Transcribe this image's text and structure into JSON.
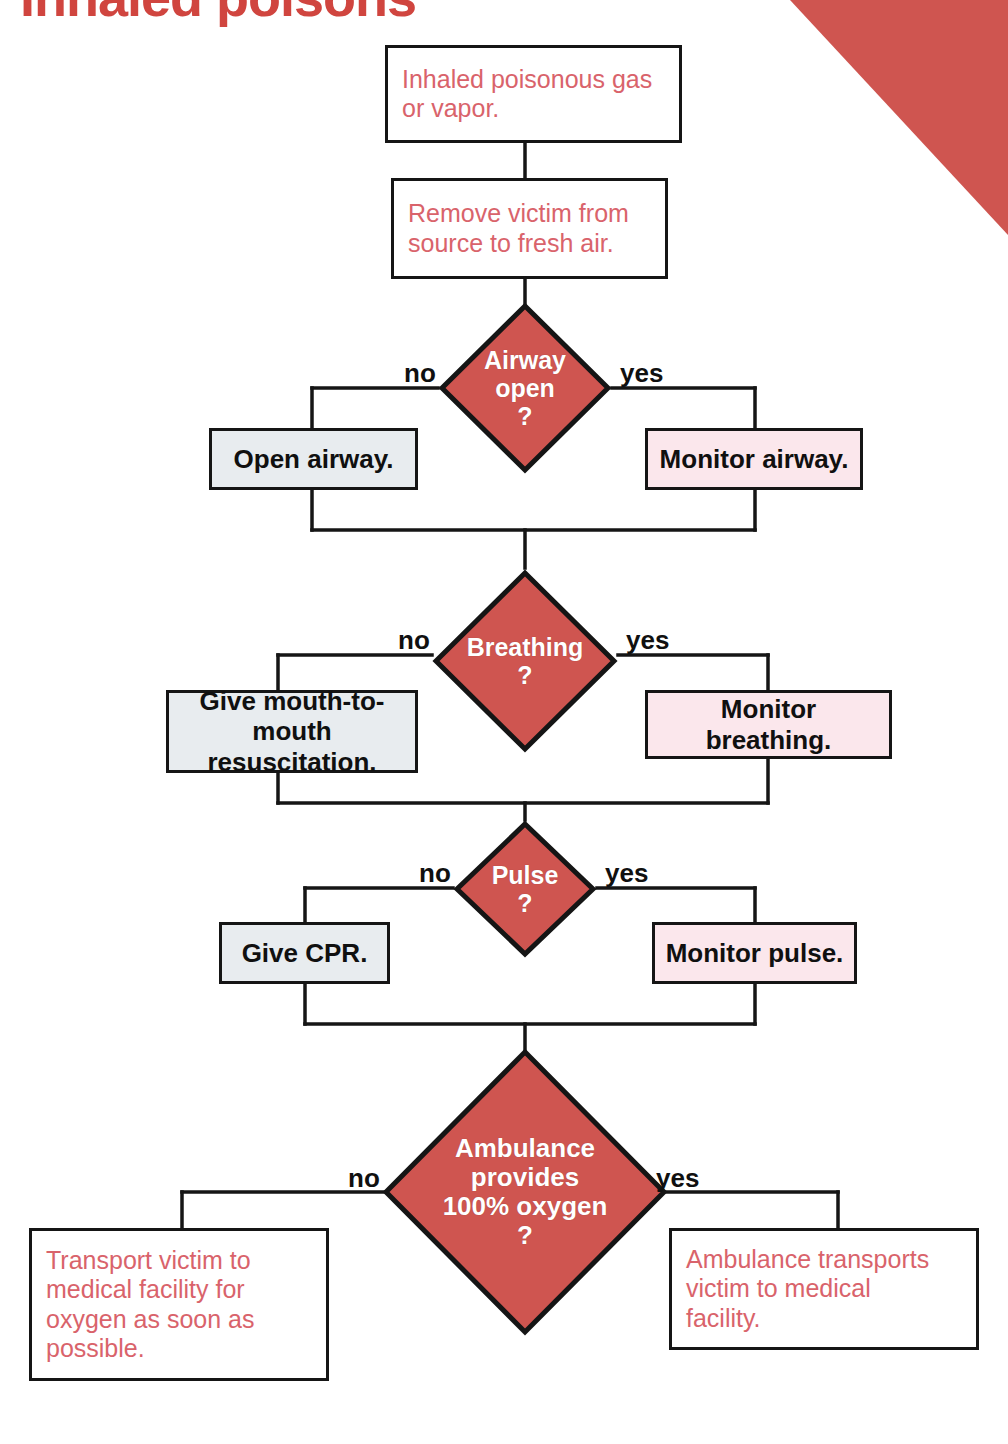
{
  "meta": {
    "title_fragment": "Inhaled poisons",
    "diagram_type": "flowchart",
    "colors": {
      "diamond_fill": "#cf5550",
      "diamond_stroke": "#151515",
      "corner_triangle": "#cf5550",
      "red_text": "#d9636b",
      "no_box_fill": "#e8ecef",
      "yes_box_fill": "#fbe7ec",
      "line": "#151515",
      "background": "#ffffff"
    }
  },
  "edge_labels": {
    "no": "no",
    "yes": "yes"
  },
  "nodes": {
    "start": {
      "id": "inhaled-poison",
      "kind": "terminal",
      "text": "Inhaled poisonous gas\nor vapor."
    },
    "remove": {
      "id": "remove-victim",
      "kind": "process",
      "text": "Remove victim from\nsource to fresh air."
    },
    "airway_decision": {
      "id": "airway-open",
      "kind": "decision",
      "text": "Airway\nopen\n?"
    },
    "airway_no": {
      "id": "open-airway",
      "kind": "action-no",
      "text": "Open airway."
    },
    "airway_yes": {
      "id": "monitor-airway",
      "kind": "action-yes",
      "text": "Monitor airway."
    },
    "breathing_decision": {
      "id": "breathing",
      "kind": "decision",
      "text": "Breathing\n?"
    },
    "breathing_no": {
      "id": "mouth-to-mouth",
      "kind": "action-no",
      "text": "Give mouth-to-\nmouth resuscitation."
    },
    "breathing_yes": {
      "id": "monitor-breathing",
      "kind": "action-yes",
      "text": "Monitor breathing."
    },
    "pulse_decision": {
      "id": "pulse",
      "kind": "decision",
      "text": "Pulse\n?"
    },
    "pulse_no": {
      "id": "give-cpr",
      "kind": "action-no",
      "text": "Give CPR."
    },
    "pulse_yes": {
      "id": "monitor-pulse",
      "kind": "action-yes",
      "text": "Monitor pulse."
    },
    "ambulance_decision": {
      "id": "ambulance-oxygen",
      "kind": "decision",
      "text": "Ambulance\nprovides\n100% oxygen\n?"
    },
    "ambulance_no": {
      "id": "transport-victim",
      "kind": "terminal",
      "text": "Transport victim to\nmedical facility for\noxygen as soon as\npossible."
    },
    "ambulance_yes": {
      "id": "ambulance-transports",
      "kind": "terminal",
      "text": "Ambulance transports\nvictim to medical\nfacility."
    }
  }
}
